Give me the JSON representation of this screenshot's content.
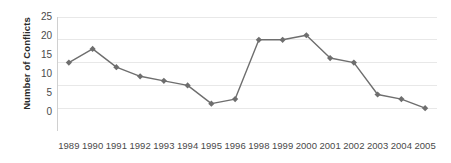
{
  "chart_data": {
    "type": "line",
    "title": "",
    "subtitle": "",
    "xlabel": "",
    "ylabel": "Number of Conflicts",
    "categories": [
      "1989",
      "1990",
      "1991",
      "1992",
      "1993",
      "1994",
      "1995",
      "1996",
      "1998",
      "1999",
      "2000",
      "2001",
      "2002",
      "2003",
      "2004",
      "2005"
    ],
    "values": [
      15,
      18,
      14,
      12,
      11,
      10,
      6,
      7,
      20,
      20,
      21,
      16,
      15,
      8,
      7,
      5
    ],
    "series": [
      {
        "name": "Number of Conflicts",
        "values": [
          15,
          18,
          14,
          12,
          11,
          10,
          6,
          7,
          20,
          20,
          21,
          16,
          15,
          8,
          7,
          5
        ]
      }
    ],
    "ylim": [
      0,
      25
    ],
    "yticks": [
      0,
      5,
      10,
      15,
      20,
      25
    ],
    "ytick_labels": [
      "0",
      "5",
      "10",
      "15",
      "20",
      "25"
    ],
    "grid": "horizontal",
    "legend": "none",
    "marker": "diamond",
    "line_color": "#6e6e6e",
    "marker_color": "#6e6e6e",
    "grid_color": "#e8e8e8",
    "axis_color": "#d0d0d0",
    "text_color": "#4a4a4a",
    "axis_title_color": "#2b2b2b",
    "background": "#ffffff"
  },
  "axes": {
    "y_title": "Number of Conflicts",
    "y_tick_labels": [
      "25",
      "20",
      "15",
      "10",
      "5",
      "0"
    ],
    "x_tick_labels": [
      "1989",
      "1990",
      "1991",
      "1992",
      "1993",
      "1994",
      "1995",
      "1996",
      "1998",
      "1999",
      "2000",
      "2001",
      "2002",
      "2003",
      "2004",
      "2005"
    ]
  }
}
